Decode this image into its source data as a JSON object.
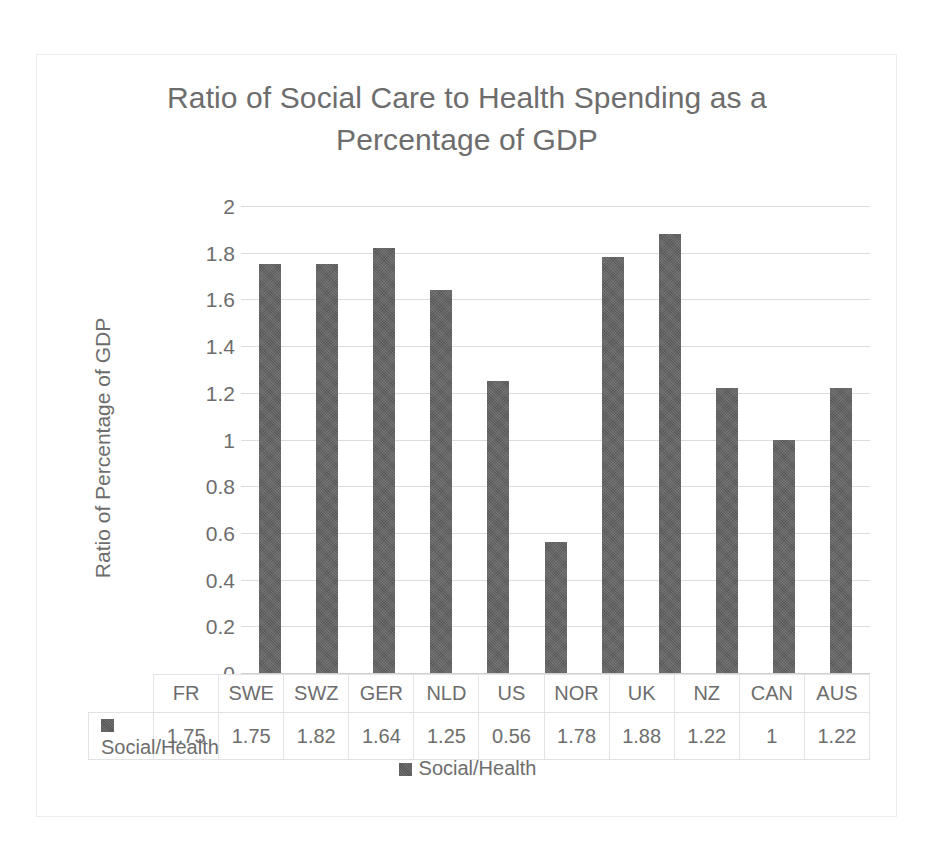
{
  "chart_data": {
    "type": "bar",
    "title": "Ratio of Social Care to Health Spending as a Percentage of GDP",
    "title_line1": "Ratio of Social Care to Health Spending as a",
    "title_line2": "Percentage of GDP",
    "xlabel": "",
    "ylabel": "Ratio of Percentage of GDP",
    "ylim": [
      0,
      2
    ],
    "ytick_labels": [
      "2",
      "1.8",
      "1.6",
      "1.4",
      "1.2",
      "1",
      "0.8",
      "0.6",
      "0.4",
      "0.2",
      "0"
    ],
    "ytick_values": [
      2,
      1.8,
      1.6,
      1.4,
      1.2,
      1,
      0.8,
      0.6,
      0.4,
      0.2,
      0
    ],
    "grid": true,
    "legend_position": "bottom",
    "bar_color": "#595959",
    "gridline_color": "#dcdcdc",
    "text_color": "#6d6d6d",
    "categories": [
      "FR",
      "SWE",
      "SWZ",
      "GER",
      "NLD",
      "US",
      "NOR",
      "UK",
      "NZ",
      "CAN",
      "AUS"
    ],
    "series": [
      {
        "name": "Social/Health",
        "values": [
          1.75,
          1.75,
          1.82,
          1.64,
          1.25,
          0.56,
          1.78,
          1.88,
          1.22,
          1,
          1.22
        ],
        "value_labels": [
          "1.75",
          "1.75",
          "1.82",
          "1.64",
          "1.25",
          "0.56",
          "1.78",
          "1.88",
          "1.22",
          "1",
          "1.22"
        ]
      }
    ]
  },
  "legend": {
    "entries": [
      {
        "label": "Social/Health",
        "color": "#595959"
      }
    ]
  },
  "data_table": {
    "row_label": "Social/Health",
    "header_cells": [
      "FR",
      "SWE",
      "SWZ",
      "GER",
      "NLD",
      "US",
      "NOR",
      "UK",
      "NZ",
      "CAN",
      "AUS"
    ],
    "value_cells": [
      "1.75",
      "1.75",
      "1.82",
      "1.64",
      "1.25",
      "0.56",
      "1.78",
      "1.88",
      "1.22",
      "1",
      "1.22"
    ]
  }
}
